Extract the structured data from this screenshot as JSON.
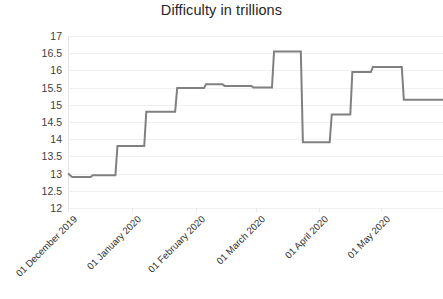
{
  "chart_data": {
    "type": "line",
    "title": "Difficulty in trillions",
    "xlabel": "",
    "ylabel": "",
    "ylim": [
      12,
      17
    ],
    "ytick_labels": [
      "17",
      "16.5",
      "16",
      "15.5",
      "15",
      "14.5",
      "14",
      "13.5",
      "13",
      "12.5",
      "12"
    ],
    "ytick_values": [
      17,
      16.5,
      16,
      15.5,
      15,
      14.5,
      14,
      13.5,
      13,
      12.5,
      12
    ],
    "grid": true,
    "legend": false,
    "legend_position": "none",
    "line_color": "#808080",
    "categories": [
      "01 December 2019",
      "01 January 2020",
      "01 February 2020",
      "01 March 2020",
      "01 April 2020",
      "01 May 2020"
    ],
    "category_x_values": [
      0,
      31,
      62,
      91,
      122,
      152
    ],
    "x_range": [
      0,
      182
    ],
    "series": [
      {
        "name": "Difficulty",
        "step_style": "post",
        "points": [
          {
            "x": 0,
            "y": 13.0
          },
          {
            "x": 2,
            "y": 12.9
          },
          {
            "x": 11,
            "y": 12.9
          },
          {
            "x": 12,
            "y": 12.95
          },
          {
            "x": 23,
            "y": 12.95
          },
          {
            "x": 24,
            "y": 13.8
          },
          {
            "x": 37,
            "y": 13.8
          },
          {
            "x": 38,
            "y": 14.8
          },
          {
            "x": 52,
            "y": 14.8
          },
          {
            "x": 53,
            "y": 15.49
          },
          {
            "x": 66,
            "y": 15.49
          },
          {
            "x": 67,
            "y": 15.6
          },
          {
            "x": 75,
            "y": 15.6
          },
          {
            "x": 76,
            "y": 15.55
          },
          {
            "x": 89,
            "y": 15.55
          },
          {
            "x": 90,
            "y": 15.5
          },
          {
            "x": 99,
            "y": 15.5
          },
          {
            "x": 100,
            "y": 16.55
          },
          {
            "x": 113,
            "y": 16.55
          },
          {
            "x": 114,
            "y": 13.91
          },
          {
            "x": 127,
            "y": 13.91
          },
          {
            "x": 128,
            "y": 14.72
          },
          {
            "x": 137,
            "y": 14.72
          },
          {
            "x": 138,
            "y": 15.95
          },
          {
            "x": 147,
            "y": 15.95
          },
          {
            "x": 148,
            "y": 16.1
          },
          {
            "x": 162,
            "y": 16.1
          },
          {
            "x": 163,
            "y": 15.15
          },
          {
            "x": 182,
            "y": 15.15
          }
        ]
      }
    ],
    "annotations": []
  },
  "bottom_caption": ""
}
